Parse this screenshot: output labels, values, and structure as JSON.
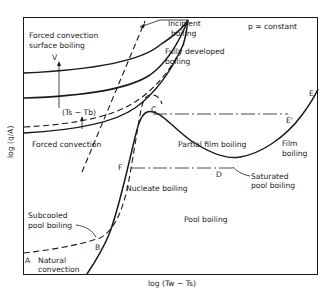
{
  "diagram": {
    "title_note": "p = constant",
    "x_axis_label": "log (Tᵥᵥ − Tₛ)",
    "x_axis_text": "log (Tw − Ts)",
    "y_axis_text": "log (q/A)",
    "labels": {
      "forced_conv_surface_boiling_1": "Forced convection",
      "forced_conv_surface_boiling_2": "surface boiling",
      "velocity": "V",
      "subcooling": "(Ts − Tb)",
      "forced_convection": "Forced convection",
      "incipient_1": "Incipient",
      "incipient_2": "boiling",
      "fully_dev_1": "Fully developed",
      "fully_dev_2": "boiling",
      "partial_film": "Partial film boiling",
      "film_1": "Film",
      "film_2": "boiling",
      "nucleate": "Nucleate boiling",
      "saturated_1": "Saturated",
      "saturated_2": "pool boiling",
      "pool": "Pool boiling",
      "subcooled_1": "Subcooled",
      "subcooled_2": "pool boiling",
      "natural_1": "Natural",
      "natural_2": "convection"
    },
    "points": {
      "A": "A",
      "B": "B",
      "C": "C",
      "D": "D",
      "E": "E",
      "E_prime": "E'",
      "F": "F"
    }
  }
}
